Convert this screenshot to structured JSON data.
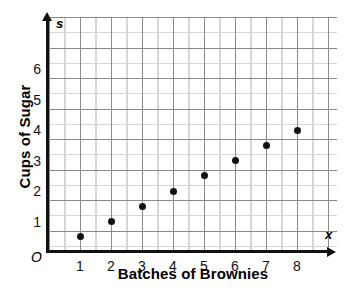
{
  "chart_data": {
    "type": "scatter",
    "title": "",
    "xlabel": "Batches of Brownies",
    "ylabel": "Cups of Sugar",
    "x_axis_variable": "x",
    "y_axis_variable": "s",
    "origin_label": "O",
    "x": [
      1,
      2,
      3,
      4,
      5,
      6,
      7,
      8
    ],
    "values": [
      0.5,
      1,
      1.5,
      2,
      2.5,
      3,
      3.5,
      4
    ],
    "points": [
      {
        "x": 1,
        "y": 0.5
      },
      {
        "x": 2,
        "y": 1
      },
      {
        "x": 3,
        "y": 1.5
      },
      {
        "x": 4,
        "y": 2
      },
      {
        "x": 5,
        "y": 2.5
      },
      {
        "x": 6,
        "y": 3
      },
      {
        "x": 7,
        "y": 3.5
      },
      {
        "x": 8,
        "y": 4
      }
    ],
    "xlim": [
      0,
      9.3
    ],
    "ylim": [
      0,
      7.7
    ],
    "x_tick_labels": [
      "1",
      "2",
      "3",
      "4",
      "5",
      "6",
      "7",
      "8"
    ],
    "y_tick_labels": [
      "1",
      "2",
      "3",
      "4",
      "5",
      "6"
    ],
    "grid": true,
    "grid_major_step_x": 1,
    "grid_major_step_y": 1,
    "grid_minor_step_x": 0.5,
    "grid_minor_step_y": 0.5,
    "legend": null,
    "colors": {
      "point": "#111111",
      "axis": "#111111",
      "grid_major": "#8a8a8a",
      "grid_minor": "#d6d6d6",
      "background": "#ffffff"
    }
  }
}
